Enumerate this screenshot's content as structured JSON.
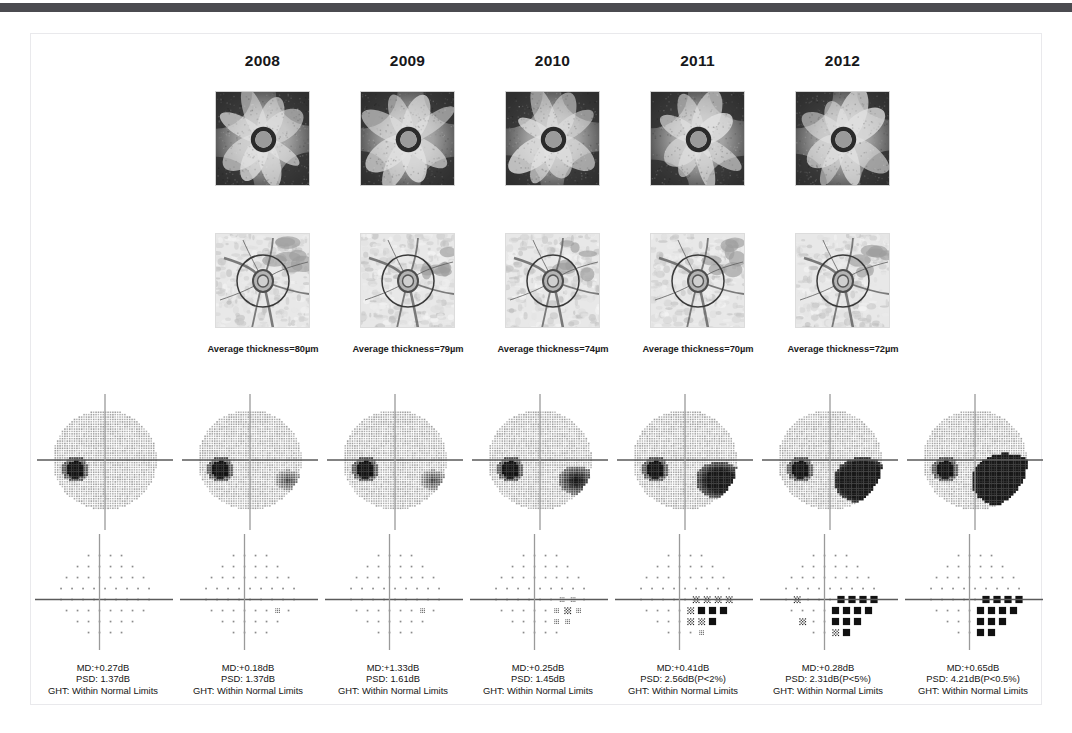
{
  "figure": {
    "top_bar_color": "#4b4b50",
    "frame_border_color": "#e9e9ec",
    "background": "#ffffff"
  },
  "years": [
    {
      "label": "2008"
    },
    {
      "label": "2009"
    },
    {
      "label": "2010"
    },
    {
      "label": "2011"
    },
    {
      "label": "2012"
    }
  ],
  "oct_columns": [
    {
      "year": "2008",
      "rnfl_map_name": "rnfl-thickness-map-2008",
      "fundus_name": "fundus-photo-2008",
      "thickness_label": "Average thickness=80µm",
      "average_thickness_um": 80
    },
    {
      "year": "2009",
      "rnfl_map_name": "rnfl-thickness-map-2009",
      "fundus_name": "fundus-photo-2009",
      "thickness_label": "Average thickness=79µm",
      "average_thickness_um": 79
    },
    {
      "year": "2010",
      "rnfl_map_name": "rnfl-thickness-map-2010",
      "fundus_name": "fundus-photo-2010",
      "thickness_label": "Average thickness=74µm",
      "average_thickness_um": 74
    },
    {
      "year": "2011",
      "rnfl_map_name": "rnfl-thickness-map-2011",
      "fundus_name": "fundus-photo-2011",
      "thickness_label": "Average thickness=70µm",
      "average_thickness_um": 70
    },
    {
      "year": "2012",
      "rnfl_map_name": "rnfl-thickness-map-2012",
      "fundus_name": "fundus-photo-2012",
      "thickness_label": "Average thickness=72µm",
      "average_thickness_um": 72
    }
  ],
  "visual_fields": [
    {
      "index": 1,
      "md_text": "MD:+0.27dB",
      "psd_text": "PSD: 1.37dB",
      "ght_text": "GHT: Within Normal Limits",
      "md_db": 0.27,
      "psd_db": 1.37,
      "psd_p": "",
      "ght": "Within Normal Limits",
      "defect_severity": 0
    },
    {
      "index": 2,
      "md_text": "MD:+0.18dB",
      "psd_text": "PSD: 1.37dB",
      "ght_text": "GHT: Within Normal Limits",
      "md_db": 0.18,
      "psd_db": 1.37,
      "psd_p": "",
      "ght": "Within Normal Limits",
      "defect_severity": 1
    },
    {
      "index": 3,
      "md_text": "MD:+1.33dB",
      "psd_text": "PSD: 1.61dB",
      "ght_text": "GHT: Within Normal Limits",
      "md_db": 1.33,
      "psd_db": 1.61,
      "psd_p": "",
      "ght": "Within Normal Limits",
      "defect_severity": 1
    },
    {
      "index": 4,
      "md_text": "MD:+0.25dB",
      "psd_text": "PSD: 1.45dB",
      "ght_text": "GHT: Within Normal Limits",
      "md_db": 0.25,
      "psd_db": 1.45,
      "psd_p": "",
      "ght": "Within Normal Limits",
      "defect_severity": 2
    },
    {
      "index": 5,
      "md_text": "MD:+0.41dB",
      "psd_text": "PSD: 2.56dB(P<2%)",
      "ght_text": "GHT: Within Normal Limits",
      "md_db": 0.41,
      "psd_db": 2.56,
      "psd_p": "P<2%",
      "ght": "Within Normal Limits",
      "defect_severity": 3
    },
    {
      "index": 6,
      "md_text": "MD:+0.28dB",
      "psd_text": "PSD: 2.31dB(P<5%)",
      "ght_text": "GHT: Within Normal Limits",
      "md_db": 0.28,
      "psd_db": 2.31,
      "psd_p": "P<5%",
      "ght": "Within Normal Limits",
      "defect_severity": 4
    },
    {
      "index": 7,
      "md_text": "MD:+0.65dB",
      "psd_text": "PSD: 4.21dB(P<0.5%)",
      "ght_text": "GHT: Within Normal Limits",
      "md_db": 0.65,
      "psd_db": 4.21,
      "psd_p": "P<0.5%",
      "ght": "Within Normal Limits",
      "defect_severity": 5
    }
  ],
  "layout": {
    "oct_column_x": [
      215,
      360,
      505,
      650,
      795
    ],
    "vf_column_x": [
      32,
      177,
      322,
      467,
      612,
      757,
      902
    ],
    "thickness_label_x": [
      188,
      333,
      478,
      623,
      768
    ]
  }
}
